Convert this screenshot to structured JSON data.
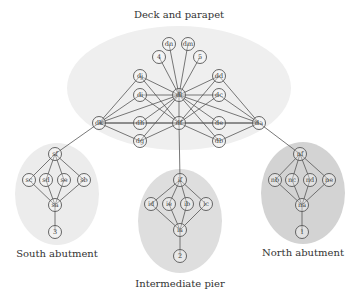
{
  "diagram": {
    "clusters": [
      {
        "id": "deck",
        "label": "Deck and parapet",
        "cx": 179,
        "cy": 88,
        "rx": 112,
        "ry": 62,
        "fill": "#efefef",
        "label_x": 179,
        "label_y": 18
      },
      {
        "id": "south",
        "label": "South abutment",
        "cx": 57,
        "cy": 194,
        "rx": 42,
        "ry": 51,
        "fill": "#ececec",
        "label_x": 57,
        "label_y": 257
      },
      {
        "id": "pier",
        "label": "Intermediate pier",
        "cx": 180,
        "cy": 221,
        "rx": 42,
        "ry": 52,
        "fill": "#dedede",
        "label_x": 180,
        "label_y": 287
      },
      {
        "id": "north",
        "label": "North abutment",
        "cx": 303,
        "cy": 193,
        "rx": 42,
        "ry": 51,
        "fill": "#d3d3d3",
        "label_x": 303,
        "label_y": 256
      }
    ],
    "nodes": [
      {
        "id": "dn",
        "label": "dn",
        "x": 169,
        "y": 44
      },
      {
        "id": "dm",
        "label": "dm",
        "x": 188,
        "y": 44
      },
      {
        "id": "4",
        "label": "4",
        "x": 159,
        "y": 57
      },
      {
        "id": "5",
        "label": "5",
        "x": 200,
        "y": 57
      },
      {
        "id": "dj",
        "label": "dj",
        "x": 140,
        "y": 76
      },
      {
        "id": "dd",
        "label": "dd",
        "x": 219,
        "y": 76
      },
      {
        "id": "di",
        "label": "di",
        "x": 140,
        "y": 95
      },
      {
        "id": "dl",
        "label": "dl",
        "x": 179,
        "y": 95
      },
      {
        "id": "dc",
        "label": "dc",
        "x": 219,
        "y": 95
      },
      {
        "id": "dk",
        "label": "dk",
        "x": 99,
        "y": 123
      },
      {
        "id": "dh",
        "label": "dh",
        "x": 140,
        "y": 123
      },
      {
        "id": "df",
        "label": "df",
        "x": 179,
        "y": 123
      },
      {
        "id": "de",
        "label": "de",
        "x": 219,
        "y": 123
      },
      {
        "id": "da",
        "label": "da",
        "x": 259,
        "y": 123
      },
      {
        "id": "dg",
        "label": "dg",
        "x": 140,
        "y": 141
      },
      {
        "id": "db",
        "label": "db",
        "x": 219,
        "y": 141
      },
      {
        "id": "sf",
        "label": "sf",
        "x": 55,
        "y": 154
      },
      {
        "id": "sc",
        "label": "sc",
        "x": 29,
        "y": 180
      },
      {
        "id": "sd",
        "label": "sd",
        "x": 46,
        "y": 180
      },
      {
        "id": "se",
        "label": "se",
        "x": 64,
        "y": 180
      },
      {
        "id": "sb",
        "label": "sb",
        "x": 84,
        "y": 180
      },
      {
        "id": "sa",
        "label": "sa",
        "x": 55,
        "y": 205
      },
      {
        "id": "3",
        "label": "3",
        "x": 55,
        "y": 232
      },
      {
        "id": "if",
        "label": "if",
        "x": 180,
        "y": 180
      },
      {
        "id": "id",
        "label": "id",
        "x": 151,
        "y": 204
      },
      {
        "id": "ie",
        "label": "ie",
        "x": 169,
        "y": 204
      },
      {
        "id": "ib",
        "label": "ib",
        "x": 187,
        "y": 204
      },
      {
        "id": "ic",
        "label": "ic",
        "x": 206,
        "y": 204
      },
      {
        "id": "ia",
        "label": "ia",
        "x": 180,
        "y": 230
      },
      {
        "id": "2",
        "label": "2",
        "x": 180,
        "y": 256
      },
      {
        "id": "nf",
        "label": "nf",
        "x": 300,
        "y": 154
      },
      {
        "id": "nb",
        "label": "nb",
        "x": 275,
        "y": 180
      },
      {
        "id": "nc",
        "label": "nc",
        "x": 292,
        "y": 180
      },
      {
        "id": "nd",
        "label": "nd",
        "x": 310,
        "y": 180
      },
      {
        "id": "ne",
        "label": "ne",
        "x": 329,
        "y": 180
      },
      {
        "id": "na",
        "label": "na",
        "x": 302,
        "y": 205
      },
      {
        "id": "1",
        "label": "1",
        "x": 302,
        "y": 232
      }
    ],
    "edges": [
      [
        "dl",
        "dn"
      ],
      [
        "dl",
        "dm"
      ],
      [
        "dl",
        "4"
      ],
      [
        "dl",
        "5"
      ],
      [
        "dl",
        "dj"
      ],
      [
        "dl",
        "di"
      ],
      [
        "dl",
        "dh"
      ],
      [
        "dl",
        "dg"
      ],
      [
        "dl",
        "dk"
      ],
      [
        "dl",
        "dd"
      ],
      [
        "dl",
        "dc"
      ],
      [
        "dl",
        "de"
      ],
      [
        "dl",
        "db"
      ],
      [
        "dl",
        "da"
      ],
      [
        "dl",
        "df"
      ],
      [
        "df",
        "dj"
      ],
      [
        "df",
        "di"
      ],
      [
        "df",
        "dh"
      ],
      [
        "df",
        "dg"
      ],
      [
        "df",
        "dk"
      ],
      [
        "df",
        "dd"
      ],
      [
        "df",
        "dc"
      ],
      [
        "df",
        "de"
      ],
      [
        "df",
        "db"
      ],
      [
        "df",
        "da"
      ],
      [
        "dk",
        "dj"
      ],
      [
        "dk",
        "di"
      ],
      [
        "dk",
        "dh"
      ],
      [
        "dk",
        "dg"
      ],
      [
        "da",
        "dd"
      ],
      [
        "da",
        "dc"
      ],
      [
        "da",
        "de"
      ],
      [
        "da",
        "db"
      ],
      [
        "dk",
        "sf"
      ],
      [
        "df",
        "if"
      ],
      [
        "da",
        "nf"
      ],
      [
        "sf",
        "sc"
      ],
      [
        "sf",
        "sd"
      ],
      [
        "sf",
        "se"
      ],
      [
        "sf",
        "sb"
      ],
      [
        "sa",
        "sc"
      ],
      [
        "sa",
        "sd"
      ],
      [
        "sa",
        "se"
      ],
      [
        "sa",
        "sb"
      ],
      [
        "sa",
        "3"
      ],
      [
        "if",
        "id"
      ],
      [
        "if",
        "ie"
      ],
      [
        "if",
        "ib"
      ],
      [
        "if",
        "ic"
      ],
      [
        "ia",
        "id"
      ],
      [
        "ia",
        "ie"
      ],
      [
        "ia",
        "ib"
      ],
      [
        "ia",
        "ic"
      ],
      [
        "ia",
        "2"
      ],
      [
        "nf",
        "nb"
      ],
      [
        "nf",
        "nc"
      ],
      [
        "nf",
        "nd"
      ],
      [
        "nf",
        "ne"
      ],
      [
        "na",
        "nb"
      ],
      [
        "na",
        "nc"
      ],
      [
        "na",
        "nd"
      ],
      [
        "na",
        "ne"
      ],
      [
        "na",
        "1"
      ]
    ],
    "node_radius": 6.5
  }
}
